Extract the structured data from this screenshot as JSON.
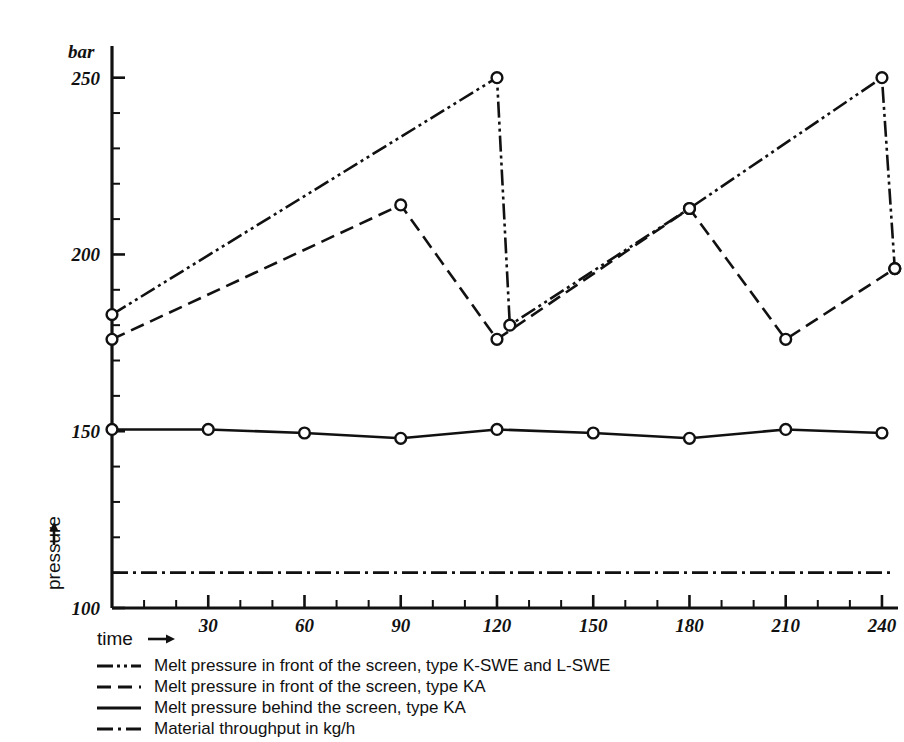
{
  "chart_data": {
    "type": "line",
    "title": "",
    "xlabel": "time",
    "ylabel": "pressure",
    "yunit": "bar",
    "xlim": [
      0,
      245
    ],
    "ylim": [
      100,
      255
    ],
    "grid": false,
    "legend_position": "below-axes",
    "x_ticks": [
      30,
      60,
      90,
      120,
      150,
      180,
      210,
      240
    ],
    "x_tick_labels": [
      "30",
      "60",
      "90",
      "120",
      "150",
      "180",
      "210",
      "240"
    ],
    "x_minor_step": 10,
    "y_ticks": [
      100,
      150,
      200,
      250
    ],
    "y_tick_labels": [
      "100",
      "150",
      "200",
      "250"
    ],
    "y_minor_step": 10,
    "series": [
      {
        "name": "Melt pressure in front of the screen, type K-SWE and L-SWE",
        "style": "dash-dot-dot",
        "markers": "open-circle",
        "x": [
          0,
          120,
          124,
          180,
          240,
          244
        ],
        "values": [
          183,
          250,
          180,
          213,
          250,
          196
        ]
      },
      {
        "name": "Melt pressure in front of the screen, type KA",
        "style": "dashed",
        "markers": "open-circle",
        "x": [
          0,
          90,
          120,
          180,
          210,
          244
        ],
        "values": [
          176,
          214,
          176,
          213,
          176,
          196
        ]
      },
      {
        "name": "Melt pressure behind the screen, type KA",
        "style": "solid",
        "markers": "open-circle",
        "x": [
          0,
          30,
          60,
          90,
          120,
          150,
          180,
          210,
          240
        ],
        "values": [
          150.5,
          150.5,
          149.5,
          148,
          150.5,
          149.5,
          148,
          150.5,
          149.5
        ]
      },
      {
        "name": "Material throughput in kg/h",
        "style": "dash-dot",
        "markers": "none",
        "x": [
          0,
          244
        ],
        "values": [
          110,
          110
        ]
      }
    ]
  },
  "axes": {
    "y_unit_label": "bar",
    "y_axis_name": "pressure",
    "x_axis_name": "time"
  },
  "legend": {
    "items": [
      {
        "key": "dash-dot-dot",
        "label": "Melt pressure in front of the screen, type K-SWE and L-SWE"
      },
      {
        "key": "dashed",
        "label": "Melt pressure in front of the screen, type KA"
      },
      {
        "key": "solid",
        "label": "Melt pressure behind the screen, type KA"
      },
      {
        "key": "dash-dot",
        "label": "Material throughput in kg/h"
      }
    ]
  },
  "colors": {
    "ink": "#111111",
    "background": "#ffffff"
  }
}
